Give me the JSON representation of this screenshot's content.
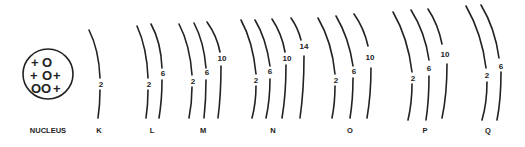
{
  "nucleus": {
    "label": "NUCLEUS",
    "rows": [
      [
        "+",
        "O"
      ],
      [
        "+",
        "O",
        "+"
      ],
      [
        "O",
        "O",
        "+"
      ]
    ]
  },
  "shells": [
    {
      "label": "K",
      "subshells": [
        "2"
      ]
    },
    {
      "label": "L",
      "subshells": [
        "2",
        "6"
      ]
    },
    {
      "label": "M",
      "subshells": [
        "2",
        "6",
        "10"
      ]
    },
    {
      "label": "N",
      "subshells": [
        "2",
        "6",
        "10",
        "14"
      ]
    },
    {
      "label": "O",
      "subshells": [
        "2",
        "6",
        "10"
      ]
    },
    {
      "label": "P",
      "subshells": [
        "2",
        "6",
        "10"
      ]
    },
    {
      "label": "Q",
      "subshells": [
        "2",
        "6"
      ]
    }
  ]
}
